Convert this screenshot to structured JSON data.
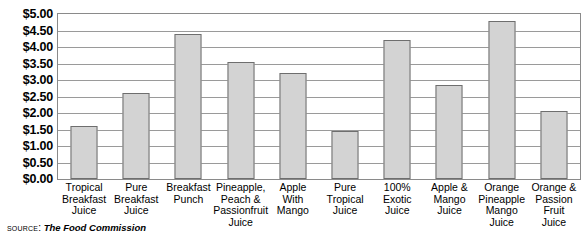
{
  "chart_data": {
    "type": "bar",
    "title": "",
    "subtitle": "",
    "xlabel": "",
    "ylabel": "",
    "ylim": [
      0,
      5
    ],
    "ytick_labels": [
      "$5.00",
      "$4.50",
      "$4.00",
      "$3.50",
      "$3.00",
      "$2.50",
      "$2.00",
      "$1.50",
      "$1.00",
      "$0.50",
      "$0.00"
    ],
    "ytick_values": [
      5.0,
      4.5,
      4.0,
      3.5,
      3.0,
      2.5,
      2.0,
      1.5,
      1.0,
      0.5,
      0.0
    ],
    "grid": true,
    "legend": "none",
    "categories": [
      "Tropical Breakfast Juice",
      "Pure Breakfast Juice",
      "Breakfast Punch",
      "Pineapple, Peach & Passionfruit Juice",
      "Apple With Mango",
      "Pure Tropical Juice",
      "100% Exotic Juice",
      "Apple & Mango Juice",
      "Orange Pineapple Mango Juice",
      "Orange & Passion Fruit Juice"
    ],
    "category_lines": [
      [
        "Tropical",
        "Breakfast",
        "Juice"
      ],
      [
        "Pure",
        "Breakfast",
        "Juice"
      ],
      [
        "Breakfast",
        "Punch"
      ],
      [
        "Pineapple,",
        "Peach &",
        "Passionfruit",
        "Juice"
      ],
      [
        "Apple",
        "With",
        "Mango"
      ],
      [
        "Pure",
        "Tropical",
        "Juice"
      ],
      [
        "100%",
        "Exotic",
        "Juice"
      ],
      [
        "Apple &",
        "Mango",
        "Juice"
      ],
      [
        "Orange",
        "Pineapple",
        "Mango",
        "Juice"
      ],
      [
        "Orange &",
        "Passion",
        "Fruit",
        "Juice"
      ]
    ],
    "values": [
      1.6,
      2.6,
      4.4,
      3.55,
      3.2,
      1.45,
      4.2,
      2.85,
      4.8,
      2.05
    ],
    "bar_color": "#d3d3d3",
    "bar_border_color": "#6e6e6e",
    "gridline_color": "#9a9a9a",
    "axis_color": "#8a8a8a"
  },
  "source": {
    "label": "Source:",
    "value": "The Food Commission"
  }
}
